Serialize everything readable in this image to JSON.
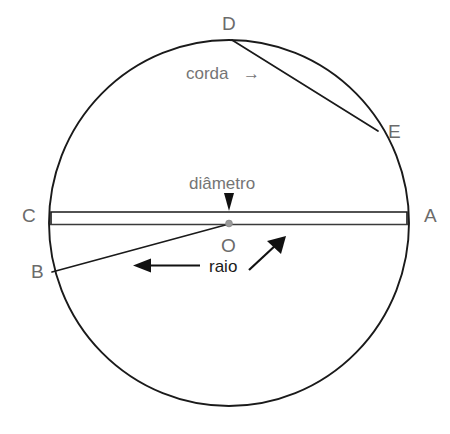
{
  "figure": {
    "background": "#ffffff",
    "stroke_color": "#1a1a1a",
    "label_color": "#6b6b6b",
    "term_color": "#757575",
    "term_color_strong": "#1a1a1a",
    "center_dot_color": "#9a9a9a"
  },
  "points": {
    "A": {
      "label": "A",
      "x": 408,
      "y": 224,
      "label_x": 424,
      "label_y": 222
    },
    "B": {
      "label": "B",
      "x": 52,
      "y": 272,
      "label_x": 31,
      "label_y": 278
    },
    "C": {
      "label": "C",
      "x": 50,
      "y": 224,
      "label_x": 24,
      "label_y": 222
    },
    "D": {
      "label": "D",
      "x": 232,
      "y": 40,
      "label_x": 224,
      "label_y": 28
    },
    "E": {
      "label": "E",
      "x": 378,
      "y": 131,
      "label_x": 389,
      "label_y": 133
    },
    "O": {
      "label": "O",
      "x": 229,
      "y": 224,
      "label_x": 222,
      "label_y": 252
    }
  },
  "circle": {
    "cx": 229,
    "cy": 223,
    "rx": 180,
    "ry": 183,
    "stroke_width": 1.8
  },
  "segments": {
    "diameter": {
      "name": "diametro",
      "from": "C",
      "to": "A",
      "style": "double-line bar",
      "top_y": 212,
      "bottom_y": 224,
      "x1": 50,
      "x2": 408
    },
    "radius_ob": {
      "name": "raio",
      "from": "O",
      "to": "B"
    },
    "chord_de": {
      "name": "corda",
      "from": "D",
      "to": "E"
    }
  },
  "annotations": {
    "corda": {
      "text": "corda",
      "arrow": "→",
      "x": 186,
      "y": 77,
      "arrow_direction": "right"
    },
    "diametro": {
      "text": "diâmetro",
      "x": 190,
      "y": 188,
      "arrow_direction": "down"
    },
    "raio": {
      "text": "raio",
      "x": 210,
      "y": 272,
      "arrow_directions": [
        "left",
        "up-right"
      ]
    }
  }
}
